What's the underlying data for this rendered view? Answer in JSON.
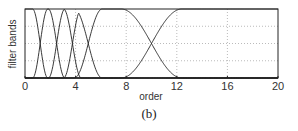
{
  "chart_data": {
    "type": "line",
    "title": "",
    "xlabel": "order",
    "ylabel": "filter bands",
    "xlim": [
      0,
      20
    ],
    "ylim": [
      0,
      1
    ],
    "xticks": [
      0,
      4,
      8,
      12,
      16,
      20
    ],
    "yticks": [
      0,
      0.5,
      1
    ],
    "grid": true,
    "legend": null,
    "band_edges": [
      1.2,
      2.5,
      3.75,
      5.0,
      10.0
    ],
    "transition_half_widths": [
      0.6,
      0.65,
      0.7,
      1.1,
      2.4
    ],
    "series_description": "Overlapping filter band windows: each band rises from 0 to 1 and falls back to 0 with smooth cosine-shaped transitions; adjacent bands cross at half height. Final band stays at 1 from order ~12 to 20."
  },
  "caption": "(b)"
}
